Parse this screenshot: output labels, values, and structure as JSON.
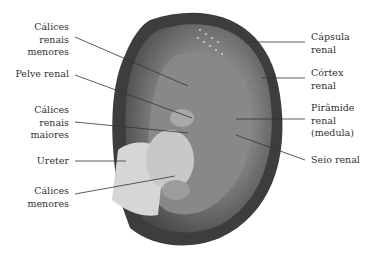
{
  "diagram": {
    "labels_left": [
      {
        "id": "calices-renais-menores",
        "lines": [
          "Cálices",
          "renais",
          "menores"
        ]
      },
      {
        "id": "pelve-renal",
        "lines": [
          "Pelve renal"
        ]
      },
      {
        "id": "calices-renais-maiores",
        "lines": [
          "Cálices",
          "renais",
          "maiores"
        ]
      },
      {
        "id": "ureter",
        "lines": [
          "Ureter"
        ]
      },
      {
        "id": "calices-menores",
        "lines": [
          "Cálices",
          "menores"
        ]
      }
    ],
    "labels_right": [
      {
        "id": "capsula-renal",
        "lines": [
          "Cápsula",
          "renal"
        ]
      },
      {
        "id": "cortex-renal",
        "lines": [
          "Córtex",
          "renal"
        ]
      },
      {
        "id": "piramide-renal",
        "lines": [
          "Pirâmide",
          "renal",
          "(medula)"
        ]
      },
      {
        "id": "seio-renal",
        "lines": [
          "Seio renal"
        ]
      }
    ],
    "colors": {
      "text": "#333333",
      "leader": "#333333",
      "capsule": "#3a3a3a",
      "cortex": "#6e6e6e",
      "medulla": "#8a8a8a",
      "ureter": "#d4d4d4"
    }
  }
}
